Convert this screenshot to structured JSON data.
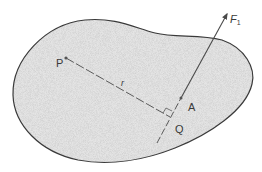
{
  "diagram": {
    "type": "rigid-body-force-moment",
    "labels": {
      "point_p": "P",
      "radius": "r",
      "point_a": "A",
      "point_q": "Q",
      "force_main": "F",
      "force_sub": "1"
    },
    "colors": {
      "outline": "#3a3a3a",
      "fill": "#dcdcdc",
      "line": "#5a5a5a",
      "background": "#ffffff"
    }
  }
}
